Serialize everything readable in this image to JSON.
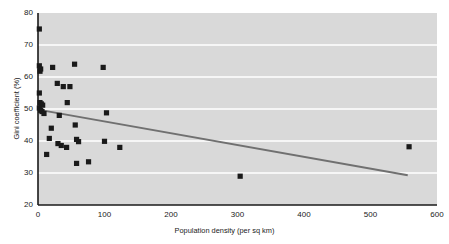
{
  "chart_data": {
    "type": "scatter",
    "title": "",
    "xlabel": "Population density (per sq km)",
    "ylabel": "Gini coefficient (%)",
    "xlim": [
      0,
      600
    ],
    "ylim": [
      20,
      80
    ],
    "xticks": [
      0,
      100,
      200,
      300,
      400,
      500,
      600
    ],
    "yticks": [
      20,
      30,
      40,
      50,
      60,
      70,
      80
    ],
    "grid": "horizontal",
    "legend": "none",
    "plot_background": "#d9d9d9",
    "gridline_color": "#ffffff",
    "marker_color": "#1a1a1a",
    "marker_shape": "square",
    "trendline": {
      "type": "linear",
      "color": "#707070",
      "x_start": 0,
      "y_start": 49.8,
      "x_end": 556,
      "y_end": 29.3
    },
    "points": [
      {
        "x": 2,
        "y": 75.0
      },
      {
        "x": 2,
        "y": 63.5
      },
      {
        "x": 4,
        "y": 62.5
      },
      {
        "x": 3,
        "y": 61.8
      },
      {
        "x": 2,
        "y": 55.0
      },
      {
        "x": 3,
        "y": 52.0
      },
      {
        "x": 5,
        "y": 51.6
      },
      {
        "x": 7,
        "y": 51.2
      },
      {
        "x": 2,
        "y": 50.3
      },
      {
        "x": 4,
        "y": 49.6
      },
      {
        "x": 6,
        "y": 49.2
      },
      {
        "x": 9,
        "y": 48.6
      },
      {
        "x": 22,
        "y": 63.0
      },
      {
        "x": 29,
        "y": 58.0
      },
      {
        "x": 38,
        "y": 57.0
      },
      {
        "x": 48,
        "y": 57.0
      },
      {
        "x": 55,
        "y": 64.0
      },
      {
        "x": 98,
        "y": 63.0
      },
      {
        "x": 44,
        "y": 52.0
      },
      {
        "x": 32,
        "y": 48.0
      },
      {
        "x": 103,
        "y": 48.8
      },
      {
        "x": 20,
        "y": 44.0
      },
      {
        "x": 56,
        "y": 45.0
      },
      {
        "x": 17,
        "y": 40.8
      },
      {
        "x": 30,
        "y": 39.2
      },
      {
        "x": 35,
        "y": 38.6
      },
      {
        "x": 43,
        "y": 38.0
      },
      {
        "x": 58,
        "y": 40.5
      },
      {
        "x": 61,
        "y": 39.8
      },
      {
        "x": 100,
        "y": 39.9
      },
      {
        "x": 123,
        "y": 38.0
      },
      {
        "x": 13,
        "y": 35.8
      },
      {
        "x": 58,
        "y": 33.0
      },
      {
        "x": 76,
        "y": 33.5
      },
      {
        "x": 304,
        "y": 29.0
      },
      {
        "x": 558,
        "y": 38.2
      }
    ]
  }
}
